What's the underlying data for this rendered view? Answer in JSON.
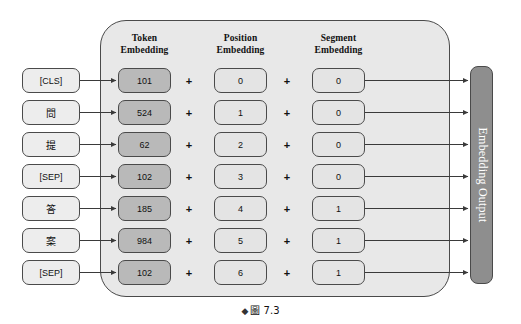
{
  "figure": {
    "caption_marker": "◆",
    "caption_label": "圖",
    "caption_number": "7.3"
  },
  "panel": {
    "columns": [
      {
        "name": "token",
        "title_line1": "Token",
        "title_line2": "Embedding"
      },
      {
        "name": "position",
        "title_line1": "Position",
        "title_line2": "Embedding"
      },
      {
        "name": "segment",
        "title_line1": "Segment",
        "title_line2": "Embedding"
      }
    ],
    "operator": "+"
  },
  "output": {
    "label": "Embedding Output"
  },
  "colors": {
    "panel_fill": "#e8e8e8",
    "token_label_fill": "#ededed",
    "token_embedding_fill": "#b9b9b9",
    "position_embedding_fill": "#e4e4e4",
    "segment_embedding_fill": "#e4e4e4",
    "output_bar_fill": "#8e8e8e",
    "stroke": "#4a4a4a"
  },
  "rows": [
    {
      "token": "[CLS]",
      "token_embedding": "101",
      "position_embedding": "0",
      "segment_embedding": "0",
      "cjk": false
    },
    {
      "token": "問",
      "token_embedding": "524",
      "position_embedding": "1",
      "segment_embedding": "0",
      "cjk": true
    },
    {
      "token": "提",
      "token_embedding": "62",
      "position_embedding": "2",
      "segment_embedding": "0",
      "cjk": true
    },
    {
      "token": "[SEP]",
      "token_embedding": "102",
      "position_embedding": "3",
      "segment_embedding": "0",
      "cjk": false
    },
    {
      "token": "答",
      "token_embedding": "185",
      "position_embedding": "4",
      "segment_embedding": "1",
      "cjk": true
    },
    {
      "token": "案",
      "token_embedding": "984",
      "position_embedding": "5",
      "segment_embedding": "1",
      "cjk": true
    },
    {
      "token": "[SEP]",
      "token_embedding": "102",
      "position_embedding": "6",
      "segment_embedding": "1",
      "cjk": false
    }
  ]
}
